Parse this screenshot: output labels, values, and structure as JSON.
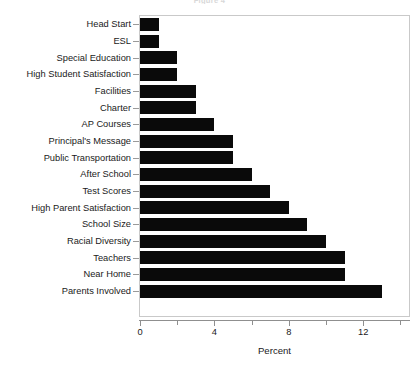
{
  "chart_data": {
    "type": "bar",
    "orientation": "horizontal",
    "title": "Figure 4",
    "xlabel": "Percent",
    "ylabel": "",
    "xlim": [
      0,
      14.5
    ],
    "xticks": [
      0,
      4,
      8,
      12
    ],
    "xtick_labels": [
      "0",
      "4",
      "8",
      "12"
    ],
    "xminor_ticks": [
      2,
      6,
      10,
      14
    ],
    "grid": false,
    "legend": null,
    "bar_color": "#0a0a0a",
    "categories": [
      "Head Start",
      "ESL",
      "Special Education",
      "High Student Satisfaction",
      "Facilities",
      "Charter",
      "AP Courses",
      "Principal's Message",
      "Public Transportation",
      "After School",
      "Test Scores",
      "High Parent Satisfaction",
      "School Size",
      "Racial Diversity",
      "Teachers",
      "Near Home",
      "Parents Involved"
    ],
    "values": [
      1,
      1,
      2,
      2,
      3,
      3,
      4,
      5,
      5,
      6,
      7,
      8,
      9,
      10,
      11,
      11,
      13
    ]
  }
}
